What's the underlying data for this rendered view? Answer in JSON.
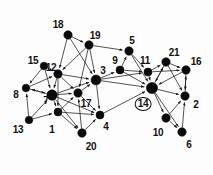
{
  "figure": {
    "name": "directed-graph-diagram",
    "background_color": "#fdfdfd",
    "node_color": "#0a0a0a",
    "edge_color": "#1a1a1a",
    "label_color": "#111111",
    "width": 213,
    "height": 175
  },
  "nodes": [
    {
      "id": "1",
      "label": "1",
      "x": 58,
      "y": 112,
      "r": 4.0,
      "lx": 52,
      "ly": 130,
      "circled": false
    },
    {
      "id": "2",
      "label": "2",
      "x": 185,
      "y": 96,
      "r": 4.2,
      "lx": 196,
      "ly": 105,
      "circled": false
    },
    {
      "id": "3",
      "label": "3",
      "x": 96,
      "y": 80,
      "r": 5.0,
      "lx": 103,
      "ly": 71,
      "circled": false
    },
    {
      "id": "4",
      "label": "4",
      "x": 100,
      "y": 115,
      "r": 4.0,
      "lx": 106,
      "ly": 127,
      "circled": false
    },
    {
      "id": "5",
      "label": "5",
      "x": 129,
      "y": 51,
      "r": 4.2,
      "lx": 132,
      "ly": 41,
      "circled": false
    },
    {
      "id": "6",
      "label": "6",
      "x": 182,
      "y": 132,
      "r": 4.2,
      "lx": 189,
      "ly": 145,
      "circled": false
    },
    {
      "id": "7",
      "label": "7",
      "x": 52,
      "y": 95,
      "r": 5.2,
      "lx": 46,
      "ly": 101,
      "circled": false
    },
    {
      "id": "8",
      "label": "8",
      "x": 26,
      "y": 88,
      "r": 3.8,
      "lx": 16,
      "ly": 95,
      "circled": false
    },
    {
      "id": "9",
      "label": "9",
      "x": 120,
      "y": 70,
      "r": 4.0,
      "lx": 115,
      "ly": 61,
      "circled": false
    },
    {
      "id": "10",
      "label": "10",
      "x": 166,
      "y": 118,
      "r": 4.2,
      "lx": 158,
      "ly": 133,
      "circled": false
    },
    {
      "id": "11",
      "label": "11",
      "x": 148,
      "y": 72,
      "r": 4.0,
      "lx": 145,
      "ly": 61,
      "circled": false
    },
    {
      "id": "12",
      "label": "12",
      "x": 58,
      "y": 74,
      "r": 4.2,
      "lx": 51,
      "ly": 68,
      "circled": false
    },
    {
      "id": "13",
      "label": "13",
      "x": 29,
      "y": 120,
      "r": 3.8,
      "lx": 18,
      "ly": 130,
      "circled": false
    },
    {
      "id": "14",
      "label": "14",
      "x": 152,
      "y": 88,
      "r": 5.6,
      "lx": 143,
      "ly": 104,
      "circled": true
    },
    {
      "id": "15",
      "label": "15",
      "x": 44,
      "y": 66,
      "r": 3.8,
      "lx": 33,
      "ly": 61,
      "circled": false
    },
    {
      "id": "16",
      "label": "16",
      "x": 186,
      "y": 70,
      "r": 4.2,
      "lx": 196,
      "ly": 62,
      "circled": false
    },
    {
      "id": "17",
      "label": "17",
      "x": 78,
      "y": 93,
      "r": 4.2,
      "lx": 86,
      "ly": 104,
      "circled": false
    },
    {
      "id": "18",
      "label": "18",
      "x": 68,
      "y": 35,
      "r": 4.2,
      "lx": 58,
      "ly": 25,
      "circled": false
    },
    {
      "id": "19",
      "label": "19",
      "x": 89,
      "y": 45,
      "r": 4.2,
      "lx": 95,
      "ly": 36,
      "circled": false
    },
    {
      "id": "20",
      "label": "20",
      "x": 82,
      "y": 133,
      "r": 4.2,
      "lx": 91,
      "ly": 147,
      "circled": false
    },
    {
      "id": "21",
      "label": "21",
      "x": 166,
      "y": 62,
      "r": 4.2,
      "lx": 174,
      "ly": 53,
      "circled": false
    }
  ],
  "edges": [
    {
      "from": "18",
      "to": "19",
      "arrow": true
    },
    {
      "from": "18",
      "to": "3",
      "arrow": true
    },
    {
      "from": "18",
      "to": "12",
      "arrow": true
    },
    {
      "from": "19",
      "to": "5",
      "arrow": true
    },
    {
      "from": "19",
      "to": "12",
      "arrow": true
    },
    {
      "from": "19",
      "to": "3",
      "arrow": true
    },
    {
      "from": "19",
      "to": "17",
      "arrow": true
    },
    {
      "from": "15",
      "to": "12",
      "arrow": true
    },
    {
      "from": "15",
      "to": "8",
      "arrow": true
    },
    {
      "from": "15",
      "to": "7",
      "arrow": true
    },
    {
      "from": "12",
      "to": "7",
      "arrow": true
    },
    {
      "from": "12",
      "to": "3",
      "arrow": true
    },
    {
      "from": "12",
      "to": "1",
      "arrow": true
    },
    {
      "from": "12",
      "to": "17",
      "arrow": true
    },
    {
      "from": "8",
      "to": "7",
      "arrow": true
    },
    {
      "from": "8",
      "to": "12",
      "arrow": true
    },
    {
      "from": "13",
      "to": "7",
      "arrow": true
    },
    {
      "from": "13",
      "to": "1",
      "arrow": true
    },
    {
      "from": "13",
      "to": "8",
      "arrow": true
    },
    {
      "from": "7",
      "to": "1",
      "arrow": true
    },
    {
      "from": "7",
      "to": "17",
      "arrow": true
    },
    {
      "from": "7",
      "to": "3",
      "arrow": true
    },
    {
      "from": "7",
      "to": "8",
      "arrow": true
    },
    {
      "from": "7",
      "to": "20",
      "arrow": true
    },
    {
      "from": "7",
      "to": "4",
      "arrow": true
    },
    {
      "from": "1",
      "to": "20",
      "arrow": true
    },
    {
      "from": "1",
      "to": "17",
      "arrow": true
    },
    {
      "from": "1",
      "to": "4",
      "arrow": true
    },
    {
      "from": "20",
      "to": "17",
      "arrow": true
    },
    {
      "from": "20",
      "to": "4",
      "arrow": true
    },
    {
      "from": "17",
      "to": "4",
      "arrow": true
    },
    {
      "from": "17",
      "to": "3",
      "arrow": true
    },
    {
      "from": "3",
      "to": "4",
      "arrow": true
    },
    {
      "from": "3",
      "to": "9",
      "arrow": true
    },
    {
      "from": "3",
      "to": "14",
      "arrow": true
    },
    {
      "from": "3",
      "to": "11",
      "arrow": true
    },
    {
      "from": "4",
      "to": "14",
      "arrow": true
    },
    {
      "from": "9",
      "to": "5",
      "arrow": true
    },
    {
      "from": "9",
      "to": "11",
      "arrow": true
    },
    {
      "from": "9",
      "to": "14",
      "arrow": true
    },
    {
      "from": "5",
      "to": "11",
      "arrow": true
    },
    {
      "from": "5",
      "to": "14",
      "arrow": true
    },
    {
      "from": "11",
      "to": "21",
      "arrow": true
    },
    {
      "from": "11",
      "to": "14",
      "arrow": true
    },
    {
      "from": "11",
      "to": "16",
      "arrow": true
    },
    {
      "from": "21",
      "to": "16",
      "arrow": true
    },
    {
      "from": "21",
      "to": "14",
      "arrow": true
    },
    {
      "from": "21",
      "to": "2",
      "arrow": true
    },
    {
      "from": "16",
      "to": "2",
      "arrow": true
    },
    {
      "from": "16",
      "to": "14",
      "arrow": true
    },
    {
      "from": "14",
      "to": "2",
      "arrow": true
    },
    {
      "from": "14",
      "to": "10",
      "arrow": true
    },
    {
      "from": "14",
      "to": "6",
      "arrow": true
    },
    {
      "from": "14",
      "to": "21",
      "arrow": true
    },
    {
      "from": "10",
      "to": "2",
      "arrow": true
    },
    {
      "from": "10",
      "to": "6",
      "arrow": true
    },
    {
      "from": "6",
      "to": "2",
      "arrow": true
    },
    {
      "from": "2",
      "to": "16",
      "arrow": true
    }
  ]
}
